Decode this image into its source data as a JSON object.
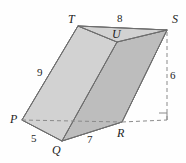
{
  "figure": {
    "background_color": "#fefefe",
    "stroke_color": "#6e6e6e",
    "dashed_color": "#8a8a8a",
    "face_left_color": "#d6d6d6",
    "face_front_color": "#cbcbcb",
    "face_right_color": "#bdbdbd",
    "face_top_color": "#d2d2d2",
    "face_bottom_color": "#c4c4c4"
  },
  "vertices": [
    {
      "name": "P",
      "label": "P",
      "x": 22,
      "y": 120
    },
    {
      "name": "Q",
      "label": "Q",
      "x": 62,
      "y": 141
    },
    {
      "name": "R",
      "label": "R",
      "x": 122,
      "y": 122
    },
    {
      "name": "T",
      "label": "T",
      "x": 78,
      "y": 26
    },
    {
      "name": "U",
      "label": "U",
      "x": 117,
      "y": 42
    },
    {
      "name": "S",
      "label": "S",
      "x": 167,
      "y": 30
    }
  ],
  "vertex_labels": [
    {
      "name": "T",
      "text": "T",
      "x": 68,
      "y": 14
    },
    {
      "name": "S",
      "text": "S",
      "x": 172,
      "y": 14
    },
    {
      "name": "U",
      "text": "U",
      "x": 112,
      "y": 29
    },
    {
      "name": "P",
      "text": "P",
      "x": 10,
      "y": 114
    },
    {
      "name": "Q",
      "text": "Q",
      "x": 52,
      "y": 144
    },
    {
      "name": "R",
      "text": "R",
      "x": 117,
      "y": 127
    }
  ],
  "measure_labels": [
    {
      "name": "edge-TS",
      "text": "8",
      "x": 117,
      "y": 13
    },
    {
      "name": "edge-PT",
      "text": "9",
      "x": 37,
      "y": 67
    },
    {
      "name": "height",
      "text": "6",
      "x": 170,
      "y": 70
    },
    {
      "name": "edge-PQ",
      "text": "5",
      "x": 31,
      "y": 134
    },
    {
      "name": "edge-QR",
      "text": "7",
      "x": 87,
      "y": 135
    }
  ],
  "right_angle": {
    "name": "right-angle-marker",
    "x": 159,
    "y": 113,
    "size": 8
  }
}
